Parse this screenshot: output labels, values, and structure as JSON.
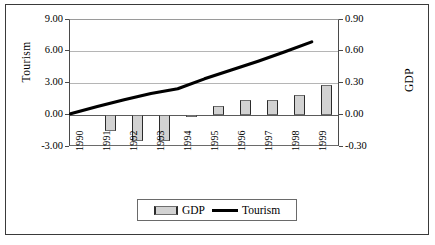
{
  "chart_data": {
    "type": "bar",
    "title": "",
    "subtitle": "",
    "xlabel": "",
    "categories": [
      "1990",
      "1991",
      "1992",
      "1993",
      "1994",
      "1995",
      "1996",
      "1997",
      "1998",
      "1999"
    ],
    "grid": true,
    "legend_position": "bottom",
    "series": [
      {
        "name": "GDP",
        "type": "bar",
        "axis": "right",
        "color": "#d2d2d2",
        "edge_color": "#2b2b2b",
        "values": [
          0.0,
          -0.15,
          -0.24,
          -0.24,
          -0.02,
          0.09,
          0.14,
          0.14,
          0.19,
          0.29
        ]
      },
      {
        "name": "Tourism",
        "type": "line",
        "axis": "left",
        "color": "#000000",
        "values": [
          0.0,
          0.7,
          1.35,
          1.95,
          2.4,
          3.35,
          4.2,
          5.05,
          5.95,
          6.9
        ]
      }
    ],
    "axes": {
      "left": {
        "label": "Tourism",
        "ylim": [
          -3.0,
          9.0
        ],
        "ticks": [
          "9.00",
          "6.00",
          "3.00",
          "0.00",
          "-3.00"
        ],
        "tick_values": [
          9.0,
          6.0,
          3.0,
          0.0,
          -3.0
        ]
      },
      "right": {
        "label": "GDP",
        "ylim": [
          -0.3,
          0.9
        ],
        "ticks": [
          "0.90",
          "0.60",
          "0.30",
          "0.00",
          "-0.30"
        ],
        "tick_values": [
          0.9,
          0.6,
          0.3,
          0.0,
          -0.3
        ]
      }
    },
    "legend": [
      {
        "name": "GDP",
        "marker": "bar-swatch"
      },
      {
        "name": "Tourism",
        "marker": "line-swatch"
      }
    ]
  }
}
